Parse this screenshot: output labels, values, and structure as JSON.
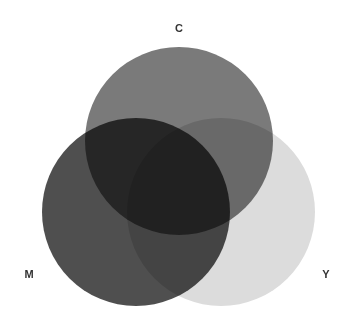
{
  "diagram": {
    "type": "venn",
    "sets": [
      {
        "id": "C",
        "label": "C",
        "cx": 179,
        "cy": 141,
        "r": 94,
        "color": "#7a7a7a",
        "opacity": 1
      },
      {
        "id": "M",
        "label": "M",
        "cx": 136,
        "cy": 212,
        "r": 94,
        "color": "#464646",
        "opacity": 0.95
      },
      {
        "id": "Y",
        "label": "Y",
        "cx": 221,
        "cy": 212,
        "r": 94,
        "color": "#dcdcdc",
        "opacity": 1
      }
    ],
    "labels": [
      {
        "text": "C",
        "x": 179,
        "y": 32
      },
      {
        "text": "M",
        "x": 29,
        "y": 278
      },
      {
        "text": "Y",
        "x": 326,
        "y": 278
      }
    ],
    "region_colors": {
      "C_only": "#7a7a7a",
      "M_only": "#424242",
      "Y_only": "#f8f8f8",
      "C_M": "#333333",
      "C_Y": "#6a6a6a",
      "M_Y": "#3a3a3a",
      "C_M_Y": "#444444"
    }
  }
}
